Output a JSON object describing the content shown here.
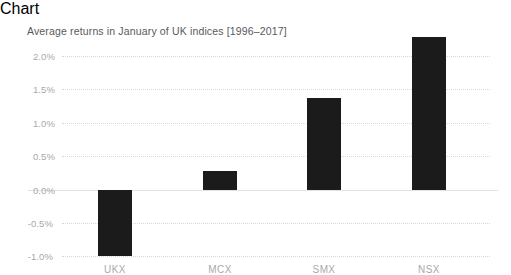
{
  "chart_data": {
    "type": "bar",
    "title": "Average returns in January of UK indices [1996–2017]",
    "xlabel": "",
    "ylabel": "",
    "categories": [
      "UKX",
      "MCX",
      "SMX",
      "NSX"
    ],
    "values": [
      -0.98,
      0.28,
      1.37,
      2.28
    ],
    "value_unit": "%",
    "series": [
      {
        "name": "Average January return",
        "values": [
          -0.98,
          0.28,
          1.37,
          2.28
        ]
      }
    ],
    "ylim": [
      -1.0,
      2.4
    ],
    "ytick_values": [
      2.0,
      1.5,
      1.0,
      0.5,
      0.0,
      -0.5,
      -1.0
    ],
    "ytick_labels": [
      "2.0%",
      "1.5%",
      "1.0%",
      "0.5%",
      "0.0%",
      "-0.5%",
      "-1.0%"
    ],
    "grid": true,
    "grid_axis": "y",
    "grid_style": "dotted",
    "legend": false,
    "legend_position": "none",
    "zero_baseline": true,
    "bar_color": "#1b1b1b",
    "grid_color": "#d9d7d8",
    "axis_color": "#e3e2e3",
    "tick_label_color": "#a9a8aa",
    "title_color": "#58595b",
    "background_color": "#ffffff"
  }
}
